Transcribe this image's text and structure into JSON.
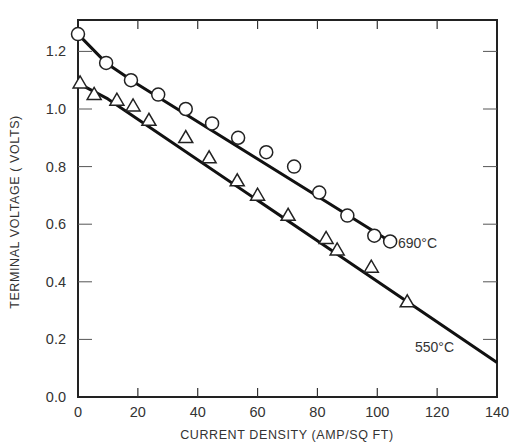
{
  "chart_data": {
    "type": "line",
    "title": "",
    "xlabel": "CURRENT DENSITY  (AMP/SQ FT)",
    "ylabel": "TERMINAL  VOLTAGE  ( VOLTS)",
    "xlim": [
      0,
      140
    ],
    "ylim": [
      0.0,
      1.3
    ],
    "xticks": [
      0,
      20,
      40,
      60,
      80,
      100,
      120,
      140
    ],
    "xtick_labels": [
      "0",
      "20",
      "40",
      "60",
      "80",
      "100",
      "120",
      "140"
    ],
    "yticks": [
      0.0,
      0.2,
      0.4,
      0.6,
      0.8,
      1.0,
      1.2
    ],
    "ytick_labels": [
      "0.0",
      "0.2",
      "0.4",
      "0.6",
      "0.8",
      "1.0",
      "1.2"
    ],
    "grid": false,
    "legend_position": "inline labels at line ends",
    "series": [
      {
        "name": "690°C",
        "marker": "circle",
        "x": [
          0,
          9.4,
          17.7,
          26.8,
          36,
          44.8,
          53.5,
          62.9,
          72.2,
          80.6,
          90,
          99,
          104.3
        ],
        "values": [
          1.26,
          1.16,
          1.1,
          1.05,
          1.0,
          0.95,
          0.9,
          0.85,
          0.8,
          0.71,
          0.63,
          0.56,
          0.54
        ],
        "fit_line": [
          [
            0,
            1.26
          ],
          [
            9.4,
            1.16
          ],
          [
            20,
            1.085
          ],
          [
            104.3,
            0.54
          ]
        ]
      },
      {
        "name": "550°C",
        "marker": "triangle",
        "x": [
          0.7,
          5.4,
          13,
          18.4,
          23.7,
          36,
          43.8,
          53.2,
          60,
          70.2,
          82.9,
          86.6,
          98,
          110
        ],
        "values": [
          1.09,
          1.05,
          1.03,
          1.01,
          0.96,
          0.9,
          0.83,
          0.75,
          0.7,
          0.63,
          0.55,
          0.51,
          0.45,
          0.33
        ],
        "fit_line": [
          [
            0,
            1.09
          ],
          [
            10,
            1.035
          ],
          [
            140,
            0.12
          ]
        ]
      }
    ],
    "annotations": [
      {
        "text": "690°C",
        "x": 106,
        "y": 0.54
      },
      {
        "text": "550°C",
        "x": 114,
        "y": 0.15
      }
    ]
  }
}
